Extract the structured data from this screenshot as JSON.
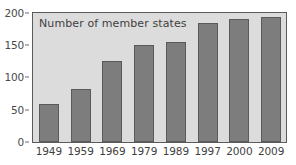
{
  "chart_data": {
    "type": "bar",
    "title": "Number of member states",
    "xlabel": "",
    "ylabel": "",
    "categories": [
      "1949",
      "1959",
      "1969",
      "1979",
      "1989",
      "1997",
      "2000",
      "2009"
    ],
    "values": [
      58,
      82,
      124,
      150,
      154,
      183,
      189,
      192
    ],
    "ylim": [
      0,
      200
    ],
    "yticks": [
      0,
      50,
      100,
      150,
      200
    ],
    "ytick_labels": [
      "0",
      "50",
      "100",
      "150",
      "200"
    ],
    "grid": false,
    "legend": null,
    "series": [
      {
        "name": "Number of member states",
        "values": [
          58,
          82,
          124,
          150,
          154,
          183,
          189,
          192
        ]
      }
    ],
    "colors": {
      "bar_fill": "#7d7d7d",
      "bar_outline": "#5a5a5a",
      "plot_background": "#dcdcdc",
      "axis": "#5b5b5b",
      "text": "#3f3f3f",
      "page_background": "#ffffff"
    }
  }
}
